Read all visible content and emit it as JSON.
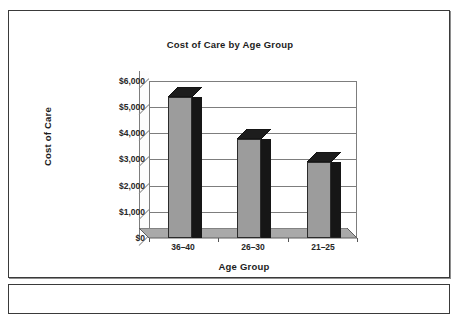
{
  "page": {
    "background": "#ffffff",
    "frame_color": "#3a3a3a"
  },
  "chart_data": {
    "type": "bar",
    "title": "Cost of Care by Age Group",
    "xlabel": "Age Group",
    "ylabel": "Cost of Care",
    "categories": [
      "36–40",
      "26–30",
      "21–25"
    ],
    "values": [
      5400,
      3800,
      2900
    ],
    "ylim": [
      0,
      6000
    ],
    "ytick_values": [
      0,
      1000,
      2000,
      3000,
      4000,
      5000,
      6000
    ],
    "ytick_labels": [
      "$0",
      "$1,000",
      "$2,000",
      "$3,000",
      "$4,000",
      "$5,000",
      "$6,000"
    ],
    "grid": true,
    "legend": false,
    "style": "3d-column",
    "bar_face_color": "#9c9c9c",
    "bar_side_color": "#161616",
    "bar_top_color": "#1d1d1d",
    "gridline_color": "#7d7d7d",
    "text_color": "#1d1d1d"
  }
}
